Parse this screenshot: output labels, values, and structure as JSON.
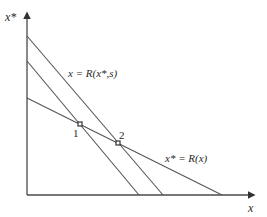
{
  "diagram": {
    "axes": {
      "y_label": "x*",
      "x_label": "x"
    },
    "curves": [
      {
        "id": "reaction-x-shifted",
        "label": "x = R(x*,s)",
        "description": "outer downward-sloping reaction curve of x (after shift by s)"
      },
      {
        "id": "reaction-x-original",
        "label": "",
        "description": "inner downward-sloping reaction curve of x (before shift)"
      },
      {
        "id": "reaction-xstar",
        "label": "x* = R(x)",
        "description": "shallower downward-sloping reaction curve of x*"
      }
    ],
    "equilibria": [
      {
        "id": "eq1",
        "label": "1"
      },
      {
        "id": "eq2",
        "label": "2"
      }
    ],
    "colors": {
      "lines": "#555555",
      "axes": "#4a4a4a",
      "text": "#2a2a2a",
      "background": "#ffffff"
    }
  }
}
